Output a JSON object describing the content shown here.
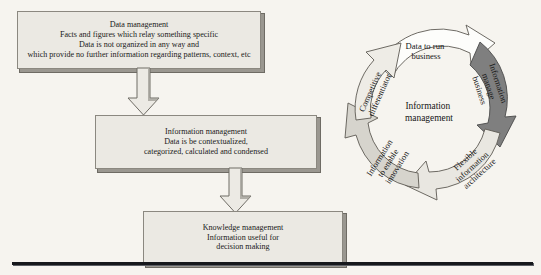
{
  "diagram": {
    "title_flow": "Data management to knowledge management flow",
    "boxes": [
      {
        "name": "data-management",
        "lines": [
          "Data management",
          "Facts and figures which relay something specific",
          "Data is not organized in any way and",
          "which provide no further information regarding patterns, context, etc"
        ]
      },
      {
        "name": "information-management",
        "lines": [
          "Information management",
          "Data is be contextualized,",
          "categorized, calculated and condensed"
        ]
      },
      {
        "name": "knowledge-management",
        "lines": [
          "Knowledge management",
          "Information useful for",
          "decision making"
        ]
      }
    ],
    "connectors": [
      {
        "name": "arrow-data-to-information",
        "direction": "down"
      },
      {
        "name": "arrow-information-to-knowledge",
        "direction": "down"
      }
    ]
  },
  "cycle": {
    "center_lines": [
      "Information",
      "management"
    ],
    "segments": [
      {
        "name": "data-to-run-business",
        "label_lines": [
          "Data to run",
          "business"
        ],
        "fill": "#fdfdfb"
      },
      {
        "name": "information-manage-business",
        "label_lines": [
          "Information",
          "manage",
          "business"
        ],
        "fill": "#7f7f7f"
      },
      {
        "name": "flexible-information-architecture",
        "label_lines": [
          "Flexible",
          "information",
          "architecture"
        ],
        "fill": "#e9e7e1"
      },
      {
        "name": "information-to-enable-innovation",
        "label_lines": [
          "Information",
          "to enable",
          "innovation"
        ],
        "fill": "#d6d4cd"
      },
      {
        "name": "competitive-differentiator",
        "label_lines": [
          "Competitive",
          "differentiator"
        ],
        "fill": "#eeece6"
      }
    ]
  },
  "colors": {
    "background": "#f6f4ef",
    "box_fill": "#ebe9e3",
    "box_border": "#8b8880",
    "box_shadow": "#6e6b64",
    "rule": "#16181c",
    "text": "#171717"
  }
}
